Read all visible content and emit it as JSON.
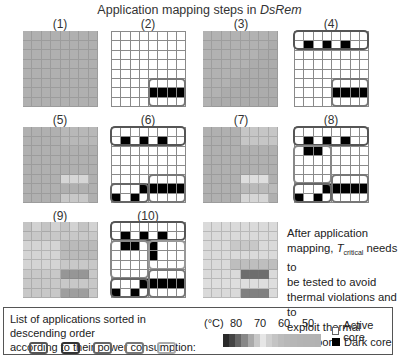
{
  "title": {
    "prefix": "Application mapping steps in ",
    "italic": "DsRem"
  },
  "panels": [
    {
      "label": "(1)",
      "type": "heatmap"
    },
    {
      "label": "(2)",
      "type": "mapping"
    },
    {
      "label": "(3)",
      "type": "heatmap"
    },
    {
      "label": "(4)",
      "type": "mapping"
    },
    {
      "label": "(5)",
      "type": "heatmap"
    },
    {
      "label": "(6)",
      "type": "mapping"
    },
    {
      "label": "(7)",
      "type": "heatmap"
    },
    {
      "label": "(8)",
      "type": "mapping"
    },
    {
      "label": "(9)",
      "type": "heatmap"
    },
    {
      "label": "(10)",
      "type": "mapping"
    },
    {
      "label": "",
      "type": "heatmap"
    }
  ],
  "mappings": {
    "2": {
      "dark": [
        [
          6,
          4
        ],
        [
          6,
          5
        ],
        [
          6,
          6
        ],
        [
          6,
          7
        ]
      ],
      "boxes": [
        {
          "r0": 5,
          "c0": 4,
          "r1": 7,
          "c1": 7,
          "shade": "#777"
        }
      ]
    },
    "4": {
      "dark": [
        [
          1,
          1
        ],
        [
          1,
          3
        ],
        [
          1,
          5
        ],
        [
          6,
          4
        ],
        [
          6,
          5
        ],
        [
          6,
          6
        ],
        [
          6,
          7
        ]
      ],
      "boxes": [
        {
          "r0": 0,
          "c0": 0,
          "r1": 1,
          "c1": 7,
          "shade": "#555"
        },
        {
          "r0": 5,
          "c0": 4,
          "r1": 7,
          "c1": 7,
          "shade": "#777"
        }
      ]
    },
    "6": {
      "dark": [
        [
          1,
          1
        ],
        [
          1,
          3
        ],
        [
          1,
          5
        ],
        [
          6,
          3
        ],
        [
          6,
          4
        ],
        [
          6,
          5
        ],
        [
          6,
          6
        ],
        [
          6,
          7
        ],
        [
          7,
          0
        ],
        [
          7,
          2
        ]
      ],
      "boxes": [
        {
          "r0": 0,
          "c0": 0,
          "r1": 1,
          "c1": 7,
          "shade": "#555"
        },
        {
          "r0": 5,
          "c0": 4,
          "r1": 7,
          "c1": 7,
          "shade": "#777"
        },
        {
          "r0": 6,
          "c0": 0,
          "r1": 7,
          "c1": 3,
          "shade": "#666"
        }
      ]
    },
    "8": {
      "dark": [
        [
          1,
          1
        ],
        [
          1,
          3
        ],
        [
          1,
          5
        ],
        [
          2,
          1
        ],
        [
          2,
          2
        ],
        [
          6,
          3
        ],
        [
          6,
          4
        ],
        [
          6,
          5
        ],
        [
          6,
          6
        ],
        [
          6,
          7
        ],
        [
          7,
          0
        ],
        [
          7,
          2
        ]
      ],
      "boxes": [
        {
          "r0": 0,
          "c0": 0,
          "r1": 1,
          "c1": 7,
          "shade": "#555"
        },
        {
          "r0": 2,
          "c0": 0,
          "r1": 5,
          "c1": 3,
          "shade": "#888"
        },
        {
          "r0": 5,
          "c0": 4,
          "r1": 7,
          "c1": 7,
          "shade": "#777"
        },
        {
          "r0": 6,
          "c0": 0,
          "r1": 7,
          "c1": 3,
          "shade": "#666"
        }
      ]
    },
    "10": {
      "dark": [
        [
          1,
          1
        ],
        [
          1,
          3
        ],
        [
          1,
          5
        ],
        [
          2,
          1
        ],
        [
          2,
          2
        ],
        [
          2,
          4
        ],
        [
          3,
          4
        ],
        [
          6,
          3
        ],
        [
          6,
          4
        ],
        [
          6,
          5
        ],
        [
          6,
          6
        ],
        [
          6,
          7
        ],
        [
          7,
          0
        ],
        [
          7,
          2
        ]
      ],
      "boxes": [
        {
          "r0": 0,
          "c0": 0,
          "r1": 1,
          "c1": 7,
          "shade": "#555"
        },
        {
          "r0": 2,
          "c0": 0,
          "r1": 5,
          "c1": 3,
          "shade": "#888"
        },
        {
          "r0": 2,
          "c0": 4,
          "r1": 4,
          "c1": 7,
          "shade": "#999"
        },
        {
          "r0": 5,
          "c0": 4,
          "r1": 7,
          "c1": 7,
          "shade": "#777"
        },
        {
          "r0": 6,
          "c0": 0,
          "r1": 7,
          "c1": 3,
          "shade": "#666"
        }
      ]
    }
  },
  "note": {
    "line1": "After application",
    "line2_pre": "mapping, ",
    "t": "T",
    "sub": "critical",
    "line2_post": " needs to",
    "line3": "be tested to avoid",
    "line4": "thermal violations and to",
    "line5": "exploit thermal headroom"
  },
  "legend": {
    "list_text_1": "List of applications sorted in descending order",
    "list_text_2": "according to their power consumption:",
    "app_swatches": [
      "#555555",
      "#333333",
      "#666666",
      "#777777",
      "#aaaaaa"
    ],
    "unit": "(°C)",
    "scale_ticks": [
      "80",
      "70",
      "60",
      "50"
    ],
    "scale_colors": [
      "#2a2a2a",
      "#444",
      "#666",
      "#888",
      "#aaa",
      "#c8c8c8",
      "#e6e6e6",
      "#d0d0d0",
      "#c4c4c4",
      "#bcbcbc",
      "#b8b8b8",
      "#b6b6b6",
      "#b4b4b4",
      "#b3b3b3",
      "#b3b3b3",
      "#b2b2b2"
    ],
    "active_core": "Active core",
    "dark_core": "Dark core"
  }
}
